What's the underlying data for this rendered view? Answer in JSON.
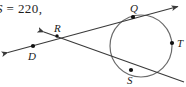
{
  "page": {
    "width": 186,
    "height": 87,
    "background_color": "#ffffff",
    "ink_color": "#3a3a3a",
    "label_color": "#1a1a1a"
  },
  "text_fragment": {
    "full": "S = 220,",
    "variable": "S",
    "equals_and_value": " = 220,",
    "note": "left-clipped text fragment at top-left corner"
  },
  "figure": {
    "type": "circle-with-tangent-and-secant",
    "circle": {
      "label": "circle",
      "center_x": 141,
      "center_y": 46,
      "radius": 31,
      "stroke": "#555555"
    },
    "points": [
      {
        "name": "Q",
        "label": "Q",
        "x": 133,
        "y": 17,
        "label_x": 131,
        "label_y": 11,
        "on": "circle"
      },
      {
        "name": "S",
        "label": "S",
        "x": 131,
        "y": 70,
        "label_x": 128,
        "label_y": 84,
        "on": "circle"
      },
      {
        "name": "T",
        "label": "T",
        "x": 172,
        "y": 43,
        "label_x": 178,
        "label_y": 47,
        "on": "circle",
        "clipped": true
      },
      {
        "name": "R",
        "label": "R",
        "x": 57,
        "y": 36,
        "label_x": 57,
        "label_y": 31,
        "on": "intersection"
      },
      {
        "name": "D",
        "label": "D",
        "x": 33,
        "y": 46,
        "label_x": 30,
        "label_y": 59,
        "on": "line"
      }
    ],
    "lines": [
      {
        "name": "line-through-D-R-Q",
        "description": "ray passing through D and R, tangent/secant touching circle at Q, arrow at upper right",
        "x1": 6,
        "y1": 53,
        "x2": 180,
        "y2": 6,
        "arrow_start": true,
        "arrow_end": true
      },
      {
        "name": "line-through-R-S",
        "description": "ray from R through circle at S continuing to lower right",
        "x1": 42,
        "y1": 31,
        "x2": 184,
        "y2": 82,
        "arrow_start": true,
        "arrow_end": false
      }
    ]
  }
}
